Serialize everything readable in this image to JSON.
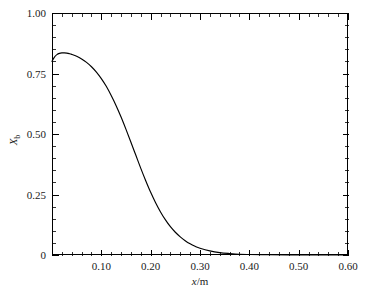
{
  "chart_data": {
    "type": "line",
    "title": "",
    "xlabel": "x/m",
    "ylabel": "X_b",
    "xlabel_parts": {
      "italic": "x",
      "slash": "/",
      "unit": "m"
    },
    "ylabel_parts": {
      "symbol": "X",
      "subscript": "b"
    },
    "xlim": [
      0.0,
      0.6
    ],
    "ylim": [
      0.0,
      1.0
    ],
    "grid": false,
    "legend": null,
    "x_major_ticks": [
      0.0,
      0.1,
      0.2,
      0.3,
      0.4,
      0.5,
      0.6
    ],
    "x_tick_labels": [
      "",
      "0.10",
      "0.20",
      "0.30",
      "0.40",
      "0.50",
      "0.60"
    ],
    "x_minor_step": 0.02,
    "y_major_ticks": [
      0.0,
      0.25,
      0.5,
      0.75,
      1.0
    ],
    "y_tick_labels": [
      "0",
      "0.25",
      "0.50",
      "0.75",
      "1.00"
    ],
    "y_minor_step": 0.05,
    "series": [
      {
        "name": "Xb",
        "color": "#000000",
        "x": [
          0.0,
          0.005,
          0.01,
          0.015,
          0.02,
          0.025,
          0.03,
          0.035,
          0.04,
          0.05,
          0.06,
          0.07,
          0.08,
          0.09,
          0.1,
          0.11,
          0.12,
          0.13,
          0.14,
          0.15,
          0.16,
          0.17,
          0.18,
          0.19,
          0.2,
          0.21,
          0.22,
          0.23,
          0.24,
          0.25,
          0.26,
          0.27,
          0.28,
          0.29,
          0.3,
          0.32,
          0.34,
          0.36,
          0.38,
          0.4,
          0.44,
          0.48,
          0.52,
          0.56,
          0.6
        ],
        "y": [
          0.8,
          0.818,
          0.828,
          0.833,
          0.835,
          0.835,
          0.834,
          0.832,
          0.829,
          0.821,
          0.81,
          0.796,
          0.778,
          0.756,
          0.729,
          0.697,
          0.659,
          0.617,
          0.57,
          0.519,
          0.466,
          0.412,
          0.358,
          0.307,
          0.259,
          0.216,
          0.178,
          0.145,
          0.117,
          0.094,
          0.075,
          0.059,
          0.046,
          0.036,
          0.028,
          0.017,
          0.01,
          0.006,
          0.003,
          0.002,
          0.001,
          0.0,
          0.0,
          0.0,
          0.0
        ]
      }
    ]
  },
  "figure": {
    "background_color": "#ffffff",
    "axis_color": "#000000",
    "plot_area": {
      "left": 52,
      "top": 13,
      "right": 348,
      "bottom": 255
    }
  }
}
